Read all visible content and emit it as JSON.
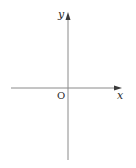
{
  "diagram": {
    "type": "coordinate-axes",
    "origin_label": "O",
    "x_axis_label": "x",
    "y_axis_label": "y",
    "colors": {
      "axis": "#8a8a8a",
      "arrow": "#3a3a3a",
      "text": "#2a2a2a"
    }
  }
}
